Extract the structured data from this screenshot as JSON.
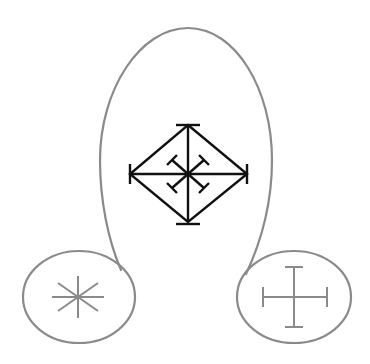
{
  "diagram": {
    "background": "#ffffff",
    "outline_color": "#8a8a8a",
    "central_symbol_color": "#111111",
    "small_symbol_color": "#8a8a8a",
    "shapes": [
      {
        "id": "big-loop",
        "label": "Large loop enclosing central symbol"
      },
      {
        "id": "left-ellipse",
        "label": "Left small ellipse with asterisk"
      },
      {
        "id": "right-ellipse",
        "label": "Right small ellipse with serifed cross"
      }
    ],
    "symbols": [
      {
        "id": "central",
        "icon": "diamond-cross-with-serifed-diagonals"
      },
      {
        "id": "left",
        "icon": "eight-spoke-asterisk"
      },
      {
        "id": "right",
        "icon": "serifed-cross"
      }
    ]
  }
}
